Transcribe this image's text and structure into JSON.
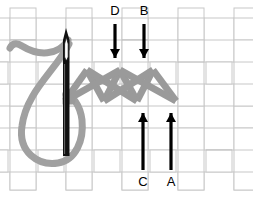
{
  "diagram": {
    "type": "embroidery-stitch-diagram",
    "canvas": {
      "width": 253,
      "height": 198,
      "background": "#ffffff"
    }
  },
  "colors": {
    "thread": "#a0a0a0",
    "thread_dark": "#8c8c8c",
    "thread_outline": "#7a7a7a",
    "needle": "#0a0a0a",
    "arrow": "#000000",
    "weave_fill": "#ffffff",
    "weave_stroke": "#c8c8c8",
    "weave_shadow": "#d9d9d9",
    "label_text": "#000000"
  },
  "fabric": {
    "name": "basket-weave-fabric",
    "cell_width": 28,
    "cell_height": 22,
    "columns": 9,
    "rows": 7,
    "origin_x": -4,
    "origin_y": 18
  },
  "needle": {
    "name": "sewing-needle",
    "tip_x": 66,
    "tip_y": 28,
    "bottom_y": 156,
    "width": 5,
    "eye_top": 36,
    "eye_bottom": 58
  },
  "thread": {
    "name": "gray-thread",
    "stroke_width": 7,
    "loop_description": "large loop from needle eye curving left and down"
  },
  "stitch": {
    "name": "herringbone-zigzag-stitch",
    "stroke_width": 7,
    "top_y": 70,
    "bottom_y": 101,
    "start_x": 65,
    "end_x": 176,
    "peaks_x": [
      87,
      120,
      153
    ],
    "valleys_x": [
      65,
      104,
      137,
      176
    ]
  },
  "arrows": [
    {
      "id": "D",
      "label": "D",
      "name": "arrow-d",
      "direction": "down",
      "x": 115,
      "tail_y": 24,
      "head_y": 66,
      "label_x": 106,
      "label_y": 5
    },
    {
      "id": "B",
      "label": "B",
      "name": "arrow-b",
      "direction": "down",
      "x": 144,
      "tail_y": 24,
      "head_y": 66,
      "label_x": 135,
      "label_y": 5
    },
    {
      "id": "C",
      "label": "C",
      "name": "arrow-c",
      "direction": "up",
      "x": 143,
      "tail_y": 170,
      "head_y": 104,
      "label_x": 134,
      "label_y": 175
    },
    {
      "id": "A",
      "label": "A",
      "name": "arrow-a",
      "direction": "up",
      "x": 171,
      "tail_y": 170,
      "head_y": 104,
      "label_x": 162,
      "label_y": 175
    }
  ]
}
